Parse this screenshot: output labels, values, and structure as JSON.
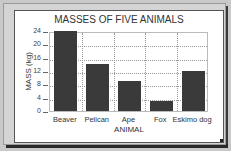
{
  "chart_data": {
    "type": "bar",
    "title": "MASSES OF FIVE ANIMALS",
    "xlabel": "ANIMAL",
    "ylabel": "MASS (kg)",
    "categories": [
      "Beaver",
      "Pelican",
      "Ape",
      "Fox",
      "Eskimo dog"
    ],
    "values": [
      24,
      14,
      9,
      3,
      12
    ],
    "ylim": [
      0,
      24
    ],
    "yticks": [
      "0",
      "4",
      "8",
      "12",
      "16",
      "20",
      "24"
    ],
    "grid": true,
    "legend": null,
    "bar_color": "#3a3a3a"
  }
}
